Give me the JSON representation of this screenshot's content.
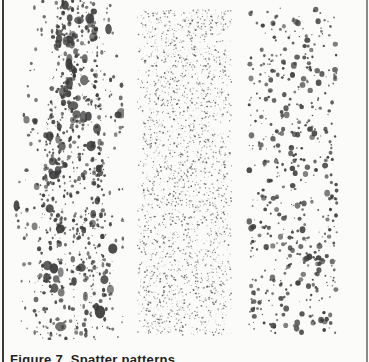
{
  "figure": {
    "caption": "Figure 7. Spatter patterns",
    "panels": [
      {
        "id": "left",
        "description": "coarse dense spatter, large irregular drops concentrated in upper-middle"
      },
      {
        "id": "middle",
        "description": "fine mist spatter, dense uniform stippling"
      },
      {
        "id": "right",
        "description": "medium-sized discrete round drops, evenly distributed"
      }
    ],
    "colors": {
      "background": "#fbfbfa",
      "ink": "#3c3c3c",
      "border": "#3a3a3a"
    }
  }
}
